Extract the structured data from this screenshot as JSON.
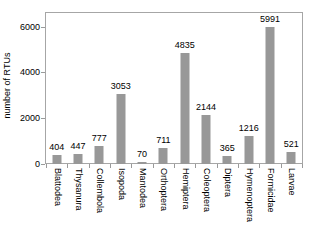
{
  "chart_data": {
    "type": "bar",
    "title": "",
    "xlabel": "",
    "ylabel": "number of RTUs",
    "categories": [
      "Blattodea",
      "Thysanura",
      "Collembola",
      "Isopoda",
      "Mantodea",
      "Orthoptera",
      "Hemiptera",
      "Coleoptera",
      "Diptera",
      "Hymenoptera",
      "Formicidae",
      "Larvae"
    ],
    "values": [
      404,
      447,
      777,
      3053,
      70,
      711,
      4835,
      2144,
      365,
      1216,
      5991,
      521
    ],
    "ylim": [
      0,
      6600
    ],
    "yticks": [
      0,
      2000,
      4000,
      6000
    ],
    "ytick_labels": [
      "0",
      "2000",
      "4000",
      "6000"
    ],
    "grid": false,
    "legend": null,
    "bar_color": "#989898",
    "frame_color": "#a6a6a6",
    "data_labels_shown": true
  },
  "axes": {
    "y_title": "number of RTUs"
  }
}
